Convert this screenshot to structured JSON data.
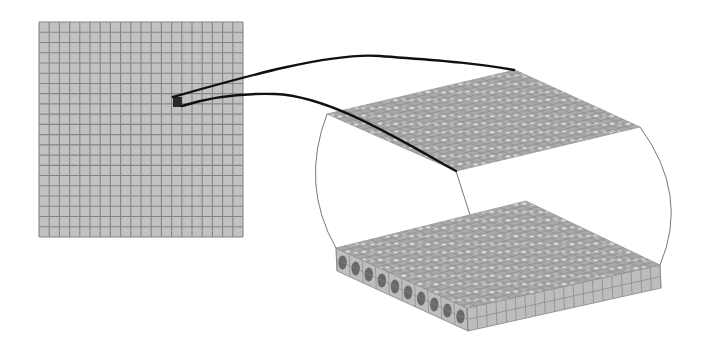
{
  "diagram": {
    "colors": {
      "background": "#ffffff",
      "cell_fill": "#c2c2c2",
      "grid_line": "#858585",
      "highlight_cell": "#2a2a2a",
      "callout_line": "#111111",
      "outline_line": "#777777",
      "plane_fill": "#a9a9a9",
      "plane_dot": "#d6d6d6",
      "slab_side_fill": "#bdbdbd",
      "fiber_fill": "#5a5a5a"
    },
    "left_mesh": {
      "label": "planar-mesh",
      "x": 39,
      "y": 22,
      "width": 204,
      "height": 215,
      "columns": 20,
      "rows": 21,
      "highlight": {
        "x": 173,
        "y": 97,
        "width": 9,
        "height": 10
      }
    },
    "callouts": {
      "upper_path": "M 173 97 C 240 78, 330 52, 380 56 S 470 62, 514 70",
      "lower_path": "M 182 106 C 210 97, 240 93, 275 94 C 330 96, 400 140, 456 171"
    },
    "top_plane": {
      "label": "top-mesh-layer",
      "corners": {
        "left": [
          327,
          114
        ],
        "back": [
          515,
          70
        ],
        "right": [
          640,
          127
        ],
        "front": [
          456,
          171
        ]
      },
      "divisions": 22
    },
    "slab": {
      "label": "meshed-slab",
      "top_corners": {
        "left": [
          336,
          248
        ],
        "back": [
          526,
          201
        ],
        "right": [
          660,
          265
        ],
        "front": [
          467,
          308
        ]
      },
      "thickness": 23,
      "divisions": 22,
      "left_face_fibers": 10,
      "right_face_columns": 20,
      "right_face_rows": 2
    },
    "outlines": {
      "left_curve": "M 327 114 Q 300 185, 336 248",
      "right_curve": "M 640 127 Q 690 195, 660 265",
      "middle_line": "M 456 171 L 470 215"
    }
  }
}
